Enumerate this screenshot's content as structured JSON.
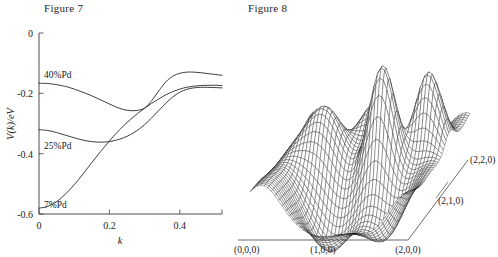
{
  "figures": {
    "left": {
      "title": "Figure 7",
      "xlabel": "k",
      "ylabel": "V(k)/eV",
      "xticks": [
        "0",
        "0.2",
        "0.4"
      ],
      "yticks": [
        "0",
        "-0.2",
        "-0.4",
        "-0.6"
      ],
      "series_labels": [
        "40%Pd",
        "25%Pd",
        "7%Pd"
      ]
    },
    "right": {
      "title": "Figure 8",
      "corner_labels": {
        "origin": "(0,0,0)",
        "x_mid": "(1,0,0)",
        "x_max": "(2,0,0)",
        "y_mid": "(2,1,0)",
        "y_max": "(2,2,0)"
      }
    }
  },
  "chart_data": [
    {
      "type": "line",
      "title": "Figure 7",
      "xlabel": "k",
      "ylabel": "V(k)/eV",
      "xlim": [
        0,
        0.52
      ],
      "ylim": [
        -0.62,
        0
      ],
      "xticks": [
        0,
        0.2,
        0.4
      ],
      "yticks": [
        0,
        -0.2,
        -0.4,
        -0.6
      ],
      "grid": false,
      "legend": "inline-labels",
      "series": [
        {
          "name": "40%Pd",
          "x": [
            0.0,
            0.025,
            0.05,
            0.075,
            0.1,
            0.125,
            0.15,
            0.175,
            0.2,
            0.22,
            0.24,
            0.26,
            0.28,
            0.3,
            0.32,
            0.34,
            0.36,
            0.38,
            0.4,
            0.42,
            0.44,
            0.46,
            0.48,
            0.5,
            0.52
          ],
          "y": [
            -0.172,
            -0.173,
            -0.177,
            -0.183,
            -0.192,
            -0.203,
            -0.215,
            -0.229,
            -0.243,
            -0.254,
            -0.262,
            -0.266,
            -0.265,
            -0.257,
            -0.232,
            -0.199,
            -0.168,
            -0.148,
            -0.138,
            -0.134,
            -0.134,
            -0.136,
            -0.139,
            -0.142,
            -0.145
          ]
        },
        {
          "name": "25%Pd",
          "x": [
            0.0,
            0.025,
            0.05,
            0.075,
            0.1,
            0.125,
            0.15,
            0.175,
            0.2,
            0.22,
            0.24,
            0.26,
            0.28,
            0.3,
            0.32,
            0.34,
            0.36,
            0.38,
            0.4,
            0.42,
            0.44,
            0.46,
            0.48,
            0.5,
            0.52
          ],
          "y": [
            -0.331,
            -0.334,
            -0.341,
            -0.35,
            -0.359,
            -0.367,
            -0.372,
            -0.374,
            -0.372,
            -0.367,
            -0.359,
            -0.348,
            -0.333,
            -0.314,
            -0.291,
            -0.266,
            -0.241,
            -0.219,
            -0.203,
            -0.193,
            -0.188,
            -0.186,
            -0.186,
            -0.187,
            -0.188
          ]
        },
        {
          "name": "7%Pd",
          "x": [
            0.0,
            0.025,
            0.05,
            0.075,
            0.1,
            0.125,
            0.15,
            0.175,
            0.2,
            0.22,
            0.24,
            0.26,
            0.28,
            0.3,
            0.32,
            0.34,
            0.36,
            0.38,
            0.4,
            0.42,
            0.44,
            0.46,
            0.48,
            0.5,
            0.52
          ],
          "y": [
            -0.6,
            -0.594,
            -0.578,
            -0.552,
            -0.52,
            -0.483,
            -0.444,
            -0.406,
            -0.37,
            -0.343,
            -0.318,
            -0.296,
            -0.276,
            -0.258,
            -0.241,
            -0.226,
            -0.212,
            -0.201,
            -0.192,
            -0.186,
            -0.182,
            -0.18,
            -0.179,
            -0.179,
            -0.18
          ]
        }
      ]
    },
    {
      "type": "surface",
      "title": "Figure 8",
      "description": "3D wireframe mesh surface over a square domain with two sharp central peaks, flanking ridges and deep valleys",
      "xlim": [
        0,
        2
      ],
      "ylim": [
        0,
        2
      ],
      "axis_corner_labels": [
        "(0,0,0)",
        "(1,0,0)",
        "(2,0,0)",
        "(2,1,0)",
        "(2,2,0)"
      ],
      "grid": true,
      "legend": "none"
    }
  ]
}
